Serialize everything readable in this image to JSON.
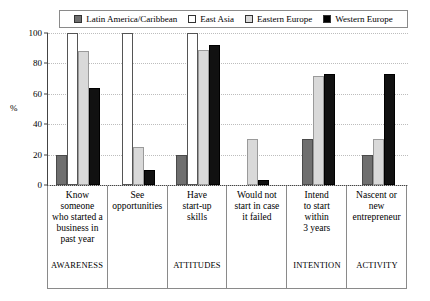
{
  "chart_data": {
    "type": "bar",
    "title": "",
    "xlabel": "",
    "ylabel": "%",
    "ylim": [
      0,
      100
    ],
    "yticks": [
      0,
      20,
      40,
      60,
      80,
      100
    ],
    "grid": true,
    "legend_position": "top",
    "categories": [
      "Know\nsomeone\nwho started a\nbusiness in\npast year",
      "See\nopportunities",
      "Have\nstart-up\nskills",
      "Would not\nstart in case\nit failed",
      "Intend\nto start\nwithin\n3 years",
      "Nascent or\nnew\nentrepreneur"
    ],
    "series": [
      {
        "name": "Latin America/Caribbean",
        "color": "#6f6f6f",
        "values": [
          20,
          0,
          20,
          0,
          30,
          20
        ]
      },
      {
        "name": "East Asia",
        "color": "#ffffff",
        "values": [
          100,
          100,
          100,
          0,
          0,
          0
        ]
      },
      {
        "name": "Eastern Europe",
        "color": "#d9d9d9",
        "values": [
          88,
          25,
          89,
          30,
          72,
          30
        ]
      },
      {
        "name": "Western Europe",
        "color": "#000000",
        "values": [
          64,
          10,
          92,
          3,
          73,
          73
        ]
      }
    ],
    "phases": [
      {
        "label": "AWARENESS",
        "span": 1
      },
      {
        "label": "ATTITUDES",
        "span": 3
      },
      {
        "label": "INTENTION",
        "span": 1
      },
      {
        "label": "ACTIVITY",
        "span": 1
      }
    ]
  }
}
